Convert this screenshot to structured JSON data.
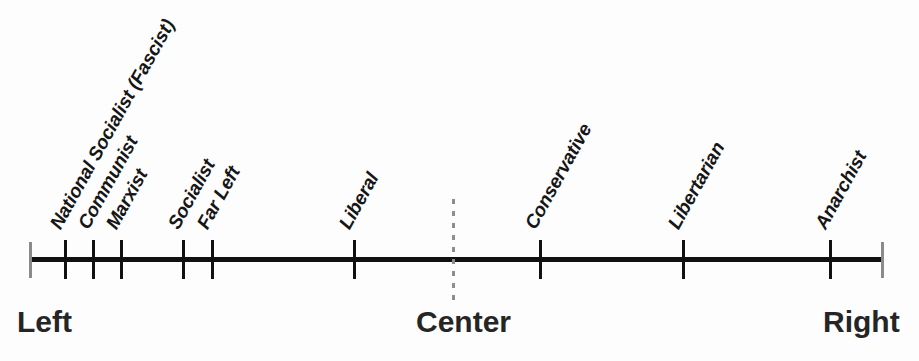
{
  "figure": {
    "name": "political-spectrum-line",
    "type": "annotated-number-line",
    "orientation": "horizontal",
    "axis": {
      "start_px": 30,
      "end_px": 883,
      "color": "#111111",
      "thickness_px": 5
    },
    "end_caps": {
      "color": "#8a8a8a",
      "left_px": 29,
      "right_px": 881
    },
    "center_divider": {
      "style": "dashed",
      "color": "#8d8d8d",
      "x_px": 453
    }
  },
  "poles": [
    {
      "label": "Left",
      "position": "left",
      "x_px": 17
    },
    {
      "label": "Center",
      "position": "center",
      "x_px": 416
    },
    {
      "label": "Right",
      "position": "right",
      "x_px": 823
    }
  ],
  "categories": [
    {
      "label": "National Socialist (Fascist)",
      "x_px": 65,
      "side": "left"
    },
    {
      "label": "Communist",
      "x_px": 93,
      "side": "left"
    },
    {
      "label": "Marxist",
      "x_px": 121,
      "side": "left"
    },
    {
      "label": "Socialist",
      "x_px": 183,
      "side": "left"
    },
    {
      "label": "Far Left",
      "x_px": 212,
      "side": "left"
    },
    {
      "label": "Liberal",
      "x_px": 354,
      "side": "left"
    },
    {
      "label": "Conservative",
      "x_px": 540,
      "side": "right"
    },
    {
      "label": "Libertarian",
      "x_px": 683,
      "side": "right"
    },
    {
      "label": "Anarchist",
      "x_px": 830,
      "side": "right"
    }
  ],
  "colors": {
    "background": "#fdfdfd",
    "axis": "#111111",
    "tick": "#111111",
    "end_cap": "#8a8a8a",
    "dashed_divider": "#8d8d8d",
    "category_text": "#161616",
    "pole_text": "#252525"
  },
  "style": {
    "category_label_rotation_deg": -61,
    "category_font_size_px": 19,
    "pole_font_size_px": 30
  }
}
